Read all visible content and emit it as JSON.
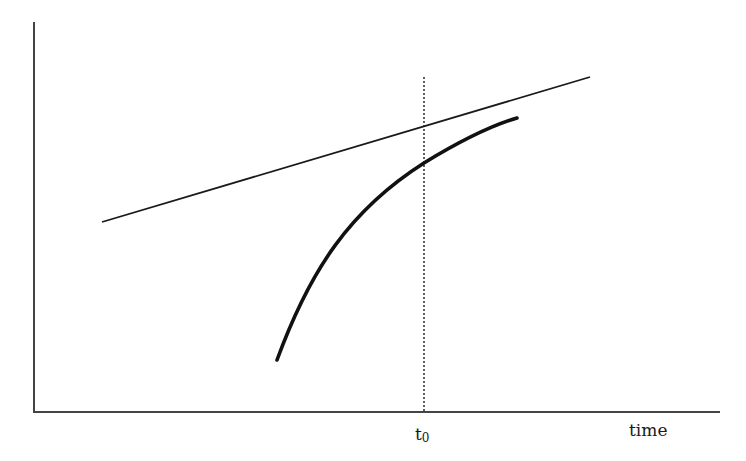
{
  "diagram": {
    "type": "line-diagram",
    "axes": {
      "x_label": "time",
      "y_label": ""
    },
    "markers": {
      "t0_main": "t",
      "t0_sub": "0"
    },
    "elements": [
      {
        "name": "straight-line",
        "style": "solid thin",
        "from": [
          102,
          222
        ],
        "to": [
          590,
          77
        ]
      },
      {
        "name": "concave-curve",
        "style": "solid thick",
        "from": [
          277,
          360
        ],
        "to": [
          517,
          118
        ]
      },
      {
        "name": "t0-vertical-marker",
        "style": "dotted",
        "x": 424
      }
    ],
    "colors": {
      "ink": "#1a1a1a",
      "axis": "#333333",
      "background": "#ffffff"
    }
  }
}
